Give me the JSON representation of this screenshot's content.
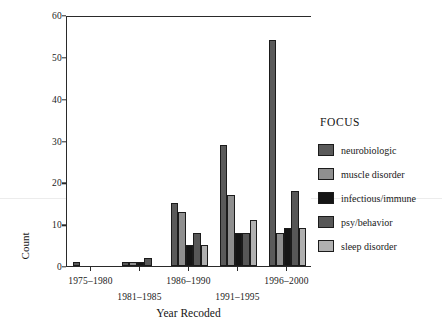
{
  "chart_data": {
    "type": "bar",
    "title": "",
    "xlabel": "Year Recoded",
    "ylabel": "Count",
    "ylim": [
      0,
      60
    ],
    "yticks": [
      0,
      10,
      20,
      30,
      40,
      50,
      60
    ],
    "ytick_labels": [
      "0",
      "10",
      "20",
      "30",
      "40",
      "50",
      "60"
    ],
    "grid": false,
    "legend_position": "right",
    "legend_title": "FOCUS",
    "categories": [
      "1975–1980",
      "1981–1985",
      "1986–1990",
      "1991–1995",
      "1996–2000"
    ],
    "series": [
      {
        "name": "neurobiologic",
        "color": "#5a5a5a",
        "values": [
          1,
          1,
          15,
          29,
          54
        ]
      },
      {
        "name": "muscle disorder",
        "color": "#8f8f8f",
        "values": [
          0,
          1,
          13,
          17,
          8
        ]
      },
      {
        "name": "infectious/immune",
        "color": "#151515",
        "values": [
          0,
          1,
          5,
          8,
          9
        ]
      },
      {
        "name": "psy/behavior",
        "color": "#575757",
        "values": [
          0,
          2,
          8,
          8,
          18
        ]
      },
      {
        "name": "sleep disorder",
        "color": "#b0b0b0",
        "values": [
          0,
          0,
          5,
          11,
          9
        ]
      }
    ]
  },
  "axis": {
    "y_title": "Count",
    "x_title": "Year Recoded"
  },
  "legend": {
    "title": "FOCUS",
    "entries": [
      {
        "label": "neurobiologic",
        "color": "#5a5a5a"
      },
      {
        "label": "muscle disorder",
        "color": "#8f8f8f"
      },
      {
        "label": "infectious/immune",
        "color": "#151515"
      },
      {
        "label": "psy/behavior",
        "color": "#575757"
      },
      {
        "label": "sleep disorder",
        "color": "#b0b0b0"
      }
    ]
  }
}
